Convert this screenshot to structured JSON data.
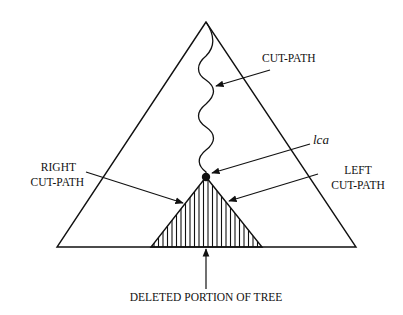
{
  "diagram": {
    "type": "tree-deletion-illustration",
    "colors": {
      "ink": "#111111",
      "background": "#ffffff"
    },
    "labels": {
      "cut_path": "CUT-PATH",
      "lca": "lca",
      "left_cut_path_line1": "LEFT",
      "left_cut_path_line2": "CUT-PATH",
      "right_cut_path_line1": "RIGHT",
      "right_cut_path_line2": "CUT-PATH",
      "deleted_portion": "DELETED PORTION OF TREE"
    },
    "shapes": {
      "outer_triangle": {
        "apex": [
          206,
          22
        ],
        "base_left": [
          57,
          247
        ],
        "base_right": [
          356,
          247
        ]
      },
      "hatched_triangle": {
        "apex": [
          206,
          177
        ],
        "base_left": [
          151,
          247
        ],
        "base_right": [
          262,
          247
        ]
      },
      "lca_node": {
        "center": [
          206,
          177
        ],
        "radius": 4
      },
      "wavy_cut_path": {
        "start": [
          206,
          22
        ],
        "end": [
          206,
          177
        ]
      }
    },
    "arrows": [
      {
        "name": "cut-path-arrow",
        "from": [
          270,
          70
        ],
        "to": [
          216,
          86
        ]
      },
      {
        "name": "lca-arrow",
        "from": [
          310,
          144
        ],
        "to": [
          212,
          173
        ]
      },
      {
        "name": "left-cut-path-arrow",
        "from": [
          318,
          174
        ],
        "to": [
          229,
          201
        ]
      },
      {
        "name": "right-cut-path-arrow",
        "from": [
          86,
          172
        ],
        "to": [
          183,
          203
        ]
      },
      {
        "name": "deleted-portion-arrow",
        "from": [
          206,
          289
        ],
        "to": [
          206,
          248
        ]
      }
    ]
  }
}
